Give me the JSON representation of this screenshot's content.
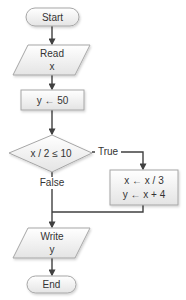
{
  "diagram": {
    "type": "flowchart",
    "nodes": {
      "start": {
        "shape": "terminal",
        "label": "Start"
      },
      "read": {
        "shape": "input-output",
        "line1": "Read",
        "line2": "x"
      },
      "assign": {
        "shape": "process",
        "label": "y ← 50"
      },
      "decision": {
        "shape": "decision",
        "label": "x / 2 ≤ 10"
      },
      "true_block": {
        "shape": "process",
        "line1": "x ← x / 3",
        "line2": "y ← x + 4"
      },
      "write": {
        "shape": "input-output",
        "line1": "Write",
        "line2": "y"
      },
      "end": {
        "shape": "terminal",
        "label": "End"
      }
    },
    "edges": {
      "true_label": "True",
      "false_label": "False"
    },
    "colors": {
      "shape_fill_top": "#ffffff",
      "shape_fill_bottom": "#e6e6e6",
      "shape_stroke": "#a6a6a6",
      "arrow": "#404040",
      "text": "#333333"
    }
  }
}
